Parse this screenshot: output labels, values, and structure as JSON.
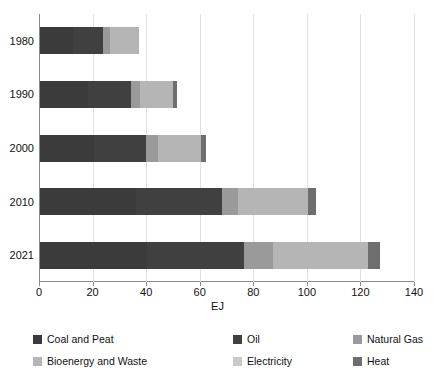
{
  "chart_data": {
    "type": "bar",
    "orientation": "horizontal",
    "stacked": true,
    "title": "",
    "xlabel": "EJ",
    "ylabel": "",
    "xlim": [
      0,
      140
    ],
    "ylim": null,
    "grid": true,
    "legend_position": "bottom",
    "categories": [
      "1980",
      "1990",
      "2000",
      "2010",
      "2021"
    ],
    "xticks": [
      0,
      20,
      40,
      60,
      80,
      100,
      120,
      140
    ],
    "series": [
      {
        "name": "Coal and Peat",
        "color": "#3b3b3b",
        "values": [
          12.5,
          18.0,
          20.0,
          36.0,
          40.0
        ]
      },
      {
        "name": "Oil",
        "color": "#404040",
        "values": [
          11.0,
          16.0,
          19.5,
          32.0,
          36.0
        ]
      },
      {
        "name": "Natural Gas",
        "color": "#9a9a9a",
        "values": [
          2.5,
          3.5,
          4.5,
          6.0,
          11.0
        ]
      },
      {
        "name": "Bioenergy and Waste",
        "color": "#b5b5b5",
        "values": [
          11.0,
          12.0,
          16.0,
          26.0,
          35.5
        ]
      },
      {
        "name": "Electricity",
        "color": "#c9c9c9",
        "values": [
          0.0,
          0.0,
          0.0,
          0.0,
          0.0
        ]
      },
      {
        "name": "Heat",
        "color": "#6e6e6e",
        "values": [
          0.0,
          1.5,
          2.0,
          3.0,
          4.5
        ]
      }
    ],
    "totals": [
      37.0,
      51.0,
      62.0,
      103.0,
      127.0
    ]
  },
  "legend": {
    "items": [
      {
        "label": "Coal and Peat"
      },
      {
        "label": "Oil"
      },
      {
        "label": "Natural Gas"
      },
      {
        "label": "Bioenergy and Waste"
      },
      {
        "label": "Electricity"
      },
      {
        "label": "Heat"
      }
    ]
  }
}
